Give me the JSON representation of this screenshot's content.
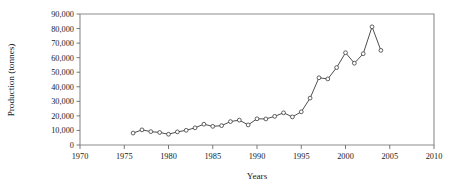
{
  "chart_data": {
    "type": "line",
    "title": "",
    "xlabel": "Years",
    "ylabel": "Production (tonnes)",
    "xlim": [
      1970,
      2010
    ],
    "ylim": [
      0,
      90000
    ],
    "grid": false,
    "legend": "none",
    "x_ticks": [
      1970,
      1975,
      1980,
      1985,
      1990,
      1995,
      2000,
      2005,
      2010
    ],
    "x_tick_labels": [
      "1970",
      "1975",
      "1980",
      "1985",
      "1990",
      "1995",
      "2000",
      "2005",
      "2010"
    ],
    "y_ticks": [
      0,
      10000,
      20000,
      30000,
      40000,
      50000,
      60000,
      70000,
      80000,
      90000
    ],
    "y_tick_labels": [
      "0",
      "10,000",
      "20,000",
      "30,000",
      "40,000",
      "50,000",
      "60,000",
      "70,000",
      "80,000",
      "90,000"
    ],
    "series": [
      {
        "name": "Production",
        "marker": "open-circle",
        "x": [
          1976,
          1977,
          1978,
          1979,
          1980,
          1981,
          1982,
          1983,
          1984,
          1985,
          1986,
          1987,
          1988,
          1989,
          1990,
          1991,
          1992,
          1993,
          1994,
          1995,
          1996,
          1997,
          1998,
          1999,
          2000,
          2001,
          2002,
          2003,
          2004
        ],
        "values": [
          8200,
          10400,
          9200,
          8600,
          7400,
          9000,
          10100,
          11800,
          14300,
          12800,
          13300,
          16100,
          17100,
          13800,
          18000,
          17900,
          19700,
          22100,
          19300,
          22800,
          32200,
          46200,
          45400,
          53200,
          63400,
          56200,
          62700,
          81200,
          65000
        ]
      }
    ]
  }
}
